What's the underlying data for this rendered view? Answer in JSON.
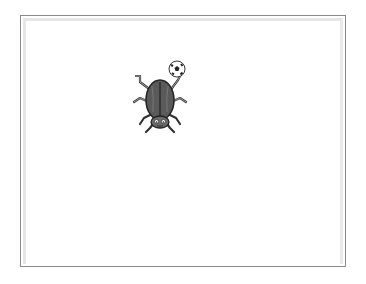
{
  "stage": {
    "background_color": "#ffffff",
    "frame_color": "#8a8a8a"
  },
  "sprite": {
    "name": "beetle",
    "icon": "beetle-icon",
    "body_color": "#555555",
    "prop": {
      "name": "soccer-ball",
      "icon": "soccer-ball-icon"
    }
  }
}
